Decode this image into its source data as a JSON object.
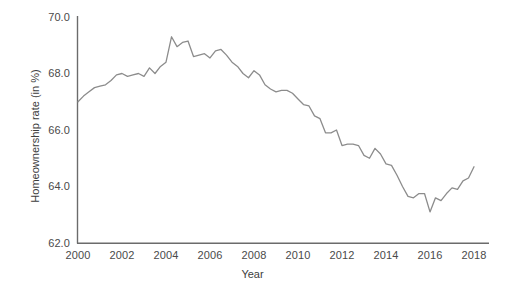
{
  "chart_data": {
    "type": "line",
    "title": "",
    "subtitle": "",
    "xlabel": "Year",
    "ylabel": "Homeownership rate (in %)",
    "xlim": [
      2000,
      2018
    ],
    "ylim": [
      62.0,
      70.0
    ],
    "grid": false,
    "legend": "none",
    "line_color": "#8c8c8c",
    "axis_color": "#6b6b6b",
    "text_color": "#3d3d3d",
    "background_color": "#ffffff",
    "xticks": [
      "2000",
      "2002",
      "2004",
      "2006",
      "2008",
      "2010",
      "2012",
      "2014",
      "2016",
      "2018"
    ],
    "yticks": [
      "62.0",
      "64.0",
      "66.0",
      "68.0",
      "70.0"
    ],
    "series": [
      {
        "name": "Homeownership rate",
        "x": [
          2000.0,
          2000.25,
          2000.5,
          2000.75,
          2001.0,
          2001.25,
          2001.5,
          2001.75,
          2002.0,
          2002.25,
          2002.5,
          2002.75,
          2003.0,
          2003.25,
          2003.5,
          2003.75,
          2004.0,
          2004.25,
          2004.5,
          2004.75,
          2005.0,
          2005.25,
          2005.5,
          2005.75,
          2006.0,
          2006.25,
          2006.5,
          2006.75,
          2007.0,
          2007.25,
          2007.5,
          2007.75,
          2008.0,
          2008.25,
          2008.5,
          2008.75,
          2009.0,
          2009.25,
          2009.5,
          2009.75,
          2010.0,
          2010.25,
          2010.5,
          2010.75,
          2011.0,
          2011.25,
          2011.5,
          2011.75,
          2012.0,
          2012.25,
          2012.5,
          2012.75,
          2013.0,
          2013.25,
          2013.5,
          2013.75,
          2014.0,
          2014.25,
          2014.5,
          2014.75,
          2015.0,
          2015.25,
          2015.5,
          2015.75,
          2016.0,
          2016.25,
          2016.5,
          2016.75,
          2017.0,
          2017.25,
          2017.5,
          2017.75,
          2018.0
        ],
        "values": [
          67.0,
          67.2,
          67.35,
          67.5,
          67.55,
          67.6,
          67.75,
          67.95,
          68.0,
          67.9,
          67.95,
          68.0,
          67.9,
          68.2,
          68.0,
          68.25,
          68.4,
          69.3,
          68.95,
          69.1,
          69.15,
          68.6,
          68.65,
          68.7,
          68.55,
          68.8,
          68.85,
          68.65,
          68.4,
          68.25,
          68.0,
          67.85,
          68.1,
          67.95,
          67.6,
          67.45,
          67.35,
          67.4,
          67.4,
          67.3,
          67.1,
          66.9,
          66.85,
          66.5,
          66.4,
          65.9,
          65.9,
          66.0,
          65.45,
          65.5,
          65.5,
          65.45,
          65.1,
          65.0,
          65.35,
          65.15,
          64.8,
          64.75,
          64.4,
          64.0,
          63.65,
          63.6,
          63.75,
          63.75,
          63.1,
          63.6,
          63.5,
          63.75,
          63.95,
          63.9,
          64.2,
          64.3,
          64.7
        ]
      }
    ]
  },
  "axes": {
    "y_title": "Homeownership rate (in %)",
    "x_title": "Year",
    "y_tick_labels": [
      "70.0",
      "68.0",
      "66.0",
      "64.0",
      "62.0"
    ],
    "x_tick_labels": [
      "2000",
      "2002",
      "2004",
      "2006",
      "2008",
      "2010",
      "2012",
      "2014",
      "2016",
      "2018"
    ]
  }
}
